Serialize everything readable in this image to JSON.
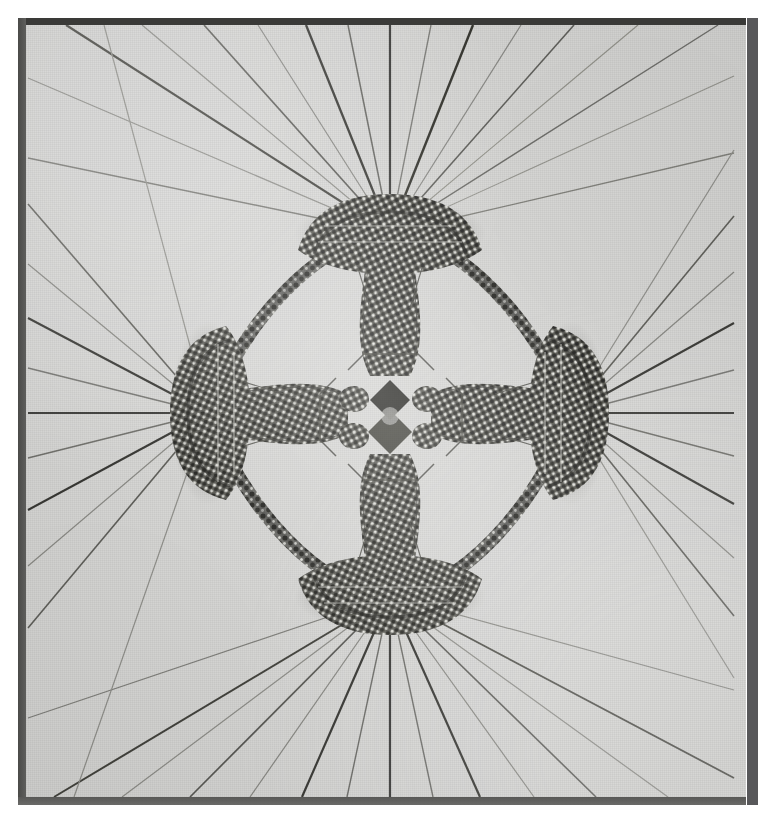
{
  "image": {
    "kind": "halftone-photograph-plate",
    "subject": "four-fold symmetric woven thread rosette with radiating straight threads",
    "orientation": "portrait",
    "width_px": 765,
    "height_px": 823
  },
  "colors": {
    "page_background": "#ffffff",
    "plate_background": "#d9d9d7",
    "frame_dark": "#3a3a38",
    "frame_left": "#4a4a48",
    "frame_right": "#58585a",
    "frame_bottom": "#5f5f5d",
    "thread_dark": "#2e2e2c",
    "thread_mid": "#6e6e6a",
    "thread_light": "#a7a7a3",
    "knot_dark": "#2a2a28",
    "knot_highlight": "#e6e6e2"
  },
  "plate": {
    "inset_left_px": 18,
    "inset_top_px": 18,
    "width_px": 728,
    "height_px": 787,
    "frame_top_px": 7,
    "frame_left_px": 8,
    "frame_bottom_px": 8,
    "frame_right_px": 13
  },
  "structure": {
    "symmetry": "4-fold (C4 / dihedral)",
    "center": {
      "x": 372,
      "y": 398
    },
    "lobe_count": 4,
    "lobes": [
      {
        "name": "top-lobe",
        "x": 372,
        "y": 215,
        "ray_fan": "upward"
      },
      {
        "name": "bottom-lobe",
        "x": 372,
        "y": 578,
        "ray_fan": "downward"
      },
      {
        "name": "left-lobe",
        "x": 190,
        "y": 395,
        "ray_fan": "leftward"
      },
      {
        "name": "right-lobe",
        "x": 553,
        "y": 395,
        "ray_fan": "rightward"
      }
    ],
    "ring": {
      "description": "braided cord arcs joining adjacent lobes",
      "arc_count": 4,
      "radius_x": 186,
      "radius_y": 186,
      "bead_pitch_px": 11
    },
    "inner_cross": {
      "description": "four columnar woven bundles converging on a small central rosette",
      "arm_count": 4
    },
    "radiating_threads": {
      "total_count": 52,
      "per_lobe": 13,
      "note": "straight threads fan out from each lobe node to the plate border"
    }
  }
}
